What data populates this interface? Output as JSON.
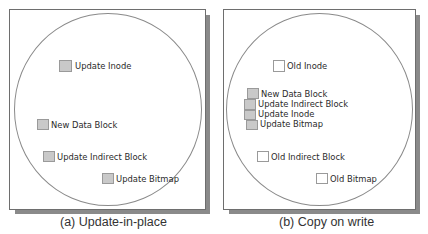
{
  "panels": [
    {
      "caption": "(a) Update-in-place",
      "blocks": [
        {
          "label": "Update Inode",
          "style": "filled"
        },
        {
          "label": "New Data Block",
          "style": "filled"
        },
        {
          "label": "Update Indirect Block",
          "style": "filled"
        },
        {
          "label": "Update Bitmap",
          "style": "filled"
        }
      ]
    },
    {
      "caption": "(b) Copy on write",
      "blocks": [
        {
          "label": "Old Inode",
          "style": "empty"
        },
        {
          "label": "New Data Block",
          "style": "filled"
        },
        {
          "label": "Update Indirect Block",
          "style": "filled"
        },
        {
          "label": "Update Inode",
          "style": "filled"
        },
        {
          "label": "Update Bitmap",
          "style": "filled"
        },
        {
          "label": "Old Indirect Block",
          "style": "empty"
        },
        {
          "label": "Old Bitmap",
          "style": "empty"
        }
      ]
    }
  ],
  "colors": {
    "filled_block": "#c9c9c9",
    "empty_block": "#ffffff",
    "border": "#6e6e6e",
    "shadow": "#8a8a8a"
  }
}
